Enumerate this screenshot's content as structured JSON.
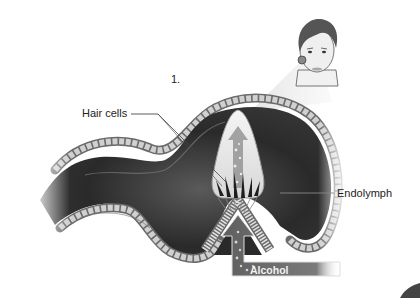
{
  "figure": {
    "step_number": "1.",
    "labels": {
      "hair_cells": "Hair cells",
      "endolymph": "Endolymph",
      "alcohol": "Alcohol"
    },
    "colors": {
      "canal_dark": "#2b2b2b",
      "canal_mid": "#555555",
      "cell_fill": "#cfcfcf",
      "cupula": "#e6e6e6",
      "arrow_bar": "#6e6e6e",
      "background": "#ffffff"
    }
  }
}
